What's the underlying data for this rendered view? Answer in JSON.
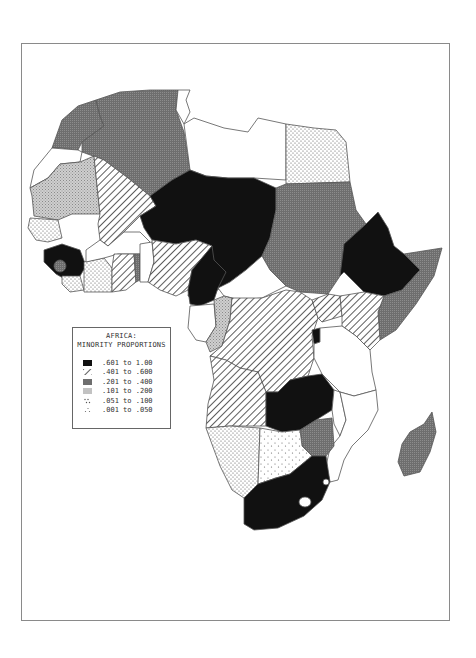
{
  "map": {
    "region": "Africa",
    "legend": {
      "title_line1": "AFRICA:",
      "title_line2": "MINORITY PROPORTIONS",
      "classes": [
        {
          "range": ".601 to 1.00",
          "pattern": "solid-black",
          "color": "#111111"
        },
        {
          "range": ".401 to .600",
          "pattern": "diagonal-hatch",
          "color": "#444444"
        },
        {
          "range": ".201 to .400",
          "pattern": "dense-gray",
          "color": "#7a7a7a"
        },
        {
          "range": ".101 to .200",
          "pattern": "crosshatch-light",
          "color": "#b5b5b5"
        },
        {
          "range": ".051 to .100",
          "pattern": "dots-medium",
          "color": "#888888"
        },
        {
          "range": ".001 to .050",
          "pattern": "dots-sparse",
          "color": "#aaaaaa"
        }
      ]
    },
    "countries": [
      {
        "name": "Morocco",
        "class": ".201 to .400"
      },
      {
        "name": "Algeria",
        "class": ".201 to .400"
      },
      {
        "name": "Tunisia",
        "class": "none"
      },
      {
        "name": "Libya",
        "class": "none"
      },
      {
        "name": "Egypt",
        "class": ".051 to .100"
      },
      {
        "name": "Western Sahara",
        "class": "none"
      },
      {
        "name": "Mauritania",
        "class": ".101 to .200"
      },
      {
        "name": "Mali",
        "class": ".401 to .600"
      },
      {
        "name": "Niger",
        "class": ".601 to 1.00"
      },
      {
        "name": "Chad",
        "class": ".601 to 1.00"
      },
      {
        "name": "Sudan",
        "class": ".201 to .400"
      },
      {
        "name": "Ethiopia",
        "class": ".601 to 1.00"
      },
      {
        "name": "Somalia",
        "class": ".201 to .400"
      },
      {
        "name": "Senegal",
        "class": ".051 to .100"
      },
      {
        "name": "Guinea",
        "class": ".601 to 1.00"
      },
      {
        "name": "Sierra Leone",
        "class": ".201 to .400"
      },
      {
        "name": "Liberia",
        "class": ".051 to .100"
      },
      {
        "name": "Ivory Coast",
        "class": ".051 to .100"
      },
      {
        "name": "Burkina Faso",
        "class": "none"
      },
      {
        "name": "Ghana",
        "class": ".401 to .600"
      },
      {
        "name": "Togo",
        "class": ".201 to .400"
      },
      {
        "name": "Benin",
        "class": "none"
      },
      {
        "name": "Nigeria",
        "class": ".401 to .600"
      },
      {
        "name": "Cameroon",
        "class": ".601 to 1.00"
      },
      {
        "name": "Central African Republic",
        "class": "none"
      },
      {
        "name": "Gabon",
        "class": "none"
      },
      {
        "name": "Congo",
        "class": ".101 to .200"
      },
      {
        "name": "Zaire",
        "class": ".401 to .600"
      },
      {
        "name": "Uganda",
        "class": ".401 to .600"
      },
      {
        "name": "Kenya",
        "class": ".401 to .600"
      },
      {
        "name": "Rwanda/Burundi",
        "class": ".601 to 1.00"
      },
      {
        "name": "Tanzania",
        "class": "none"
      },
      {
        "name": "Angola",
        "class": ".401 to .600"
      },
      {
        "name": "Zambia",
        "class": ".601 to 1.00"
      },
      {
        "name": "Malawi",
        "class": "none"
      },
      {
        "name": "Mozambique",
        "class": "none"
      },
      {
        "name": "Zimbabwe",
        "class": ".201 to .400"
      },
      {
        "name": "Namibia",
        "class": ".051 to .100"
      },
      {
        "name": "Botswana",
        "class": ".051 to .100"
      },
      {
        "name": "South Africa",
        "class": ".601 to 1.00"
      },
      {
        "name": "Madagascar",
        "class": ".201 to .400"
      }
    ]
  }
}
